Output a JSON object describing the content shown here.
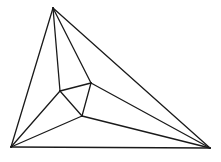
{
  "diagram": {
    "type": "planar-triangulation",
    "stroke_color": "#1a1a1a",
    "background": "#ffffff",
    "vertices": {
      "top": [
        53,
        8
      ],
      "bottom_left": [
        11,
        147
      ],
      "bottom_right": [
        210,
        148
      ],
      "inner_left": [
        60,
        91
      ],
      "inner_right": [
        91,
        83
      ],
      "inner_bottom": [
        82,
        116
      ]
    },
    "edges": [
      [
        "top",
        "bottom_left"
      ],
      [
        "top",
        "bottom_right"
      ],
      [
        "bottom_left",
        "bottom_right"
      ],
      [
        "top",
        "inner_left"
      ],
      [
        "top",
        "inner_right"
      ],
      [
        "inner_left",
        "inner_right"
      ],
      [
        "inner_right",
        "inner_bottom"
      ],
      [
        "inner_left",
        "inner_bottom"
      ],
      [
        "bottom_left",
        "inner_left"
      ],
      [
        "bottom_left",
        "inner_bottom"
      ],
      [
        "bottom_right",
        "inner_right"
      ],
      [
        "bottom_right",
        "inner_bottom"
      ]
    ]
  }
}
